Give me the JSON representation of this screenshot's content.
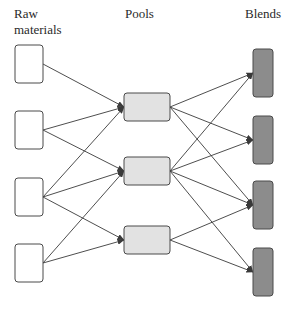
{
  "headers": {
    "raw": "Raw\nmaterials",
    "pools": "Pools",
    "blends": "Blends"
  },
  "colors": {
    "raw_fill": "#ffffff",
    "pool_fill": "#e2e2e2",
    "blend_fill": "#8c8c8c",
    "stroke": "#4a4a4a",
    "edge": "#3a3a3a"
  },
  "nodes": {
    "raw": [
      {
        "id": "R1",
        "x": 15,
        "y": 45,
        "w": 28,
        "h": 38
      },
      {
        "id": "R2",
        "x": 15,
        "y": 111,
        "w": 28,
        "h": 38
      },
      {
        "id": "R3",
        "x": 15,
        "y": 178,
        "w": 28,
        "h": 38
      },
      {
        "id": "R4",
        "x": 15,
        "y": 244,
        "w": 28,
        "h": 38
      }
    ],
    "pools": [
      {
        "id": "P1",
        "x": 124,
        "y": 93,
        "w": 46,
        "h": 28
      },
      {
        "id": "P2",
        "x": 124,
        "y": 157,
        "w": 46,
        "h": 28
      },
      {
        "id": "P3",
        "x": 124,
        "y": 226,
        "w": 46,
        "h": 28
      }
    ],
    "blends": [
      {
        "id": "B1",
        "x": 253,
        "y": 49,
        "w": 20,
        "h": 48
      },
      {
        "id": "B2",
        "x": 253,
        "y": 116,
        "w": 20,
        "h": 48
      },
      {
        "id": "B3",
        "x": 253,
        "y": 181,
        "w": 20,
        "h": 48
      },
      {
        "id": "B4",
        "x": 253,
        "y": 248,
        "w": 20,
        "h": 48
      }
    ]
  },
  "edges": [
    [
      "R1",
      "P1"
    ],
    [
      "R2",
      "P1"
    ],
    [
      "R2",
      "P2"
    ],
    [
      "R3",
      "P1"
    ],
    [
      "R3",
      "P2"
    ],
    [
      "R3",
      "P3"
    ],
    [
      "R4",
      "P2"
    ],
    [
      "R4",
      "P3"
    ],
    [
      "P1",
      "B1"
    ],
    [
      "P1",
      "B2"
    ],
    [
      "P1",
      "B3"
    ],
    [
      "P2",
      "B1"
    ],
    [
      "P2",
      "B2"
    ],
    [
      "P2",
      "B3"
    ],
    [
      "P2",
      "B4"
    ],
    [
      "P3",
      "B3"
    ],
    [
      "P3",
      "B4"
    ]
  ]
}
